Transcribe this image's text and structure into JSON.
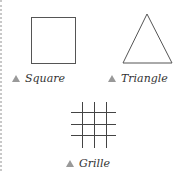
{
  "figures": [
    {
      "name": "square",
      "label": "Square"
    },
    {
      "name": "triangle",
      "label": "Triangle"
    },
    {
      "name": "grille",
      "label": "Grille"
    }
  ],
  "colors": {
    "stroke": "#555555",
    "marker": "#999999",
    "border": "#c8c8c8"
  }
}
